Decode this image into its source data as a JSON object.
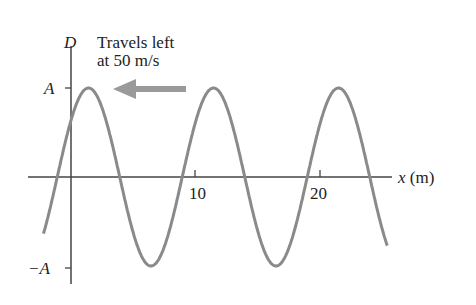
{
  "chart_data": {
    "type": "line",
    "title": "",
    "annotation": {
      "line1": "Travels left",
      "line2": "at 50 m/s",
      "arrow_direction": "left"
    },
    "xlabel": "x (m)",
    "ylabel": "D",
    "x_ticks": [
      {
        "value": 10,
        "label": "10"
      },
      {
        "value": 20,
        "label": "20"
      }
    ],
    "y_ticks": [
      {
        "value": "A",
        "label": "A"
      },
      {
        "value": "-A",
        "label": "−A"
      }
    ],
    "series": [
      {
        "name": "D(x)",
        "function": "sinusoid",
        "amplitude": "A",
        "wavelength_m": 10,
        "speed_m_per_s": 50,
        "x_range": [
          -2.2,
          25.3
        ],
        "peaks_x": [
          1.4,
          11.4,
          21.4
        ],
        "troughs_x": [
          6.4,
          16.4
        ],
        "color": "#8a8a8a"
      }
    ],
    "grid": false,
    "colors": {
      "curve": "#8a8a8a",
      "arrow": "#9a9a9a",
      "axis": "#333333"
    }
  },
  "labels": {
    "d": "D",
    "a": "A",
    "neg_a": "−A",
    "x_axis": "x (m)",
    "tick10": "10",
    "tick20": "20",
    "travel1": "Travels left",
    "travel2": "at 50 m/s"
  }
}
